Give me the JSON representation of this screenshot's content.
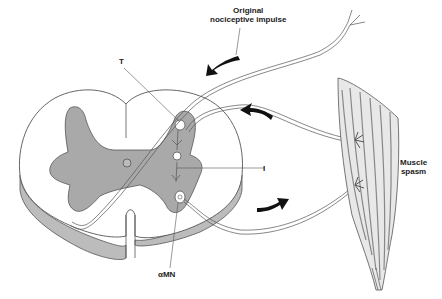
{
  "labels": {
    "original_impulse_line1": "Original",
    "original_impulse_line2": "nociceptive impulse",
    "T": "T",
    "I": "I",
    "alpha_mn": "αMN",
    "muscle_spasm_line1": "Muscle",
    "muscle_spasm_line2": "spasm"
  },
  "colors": {
    "outline": "#555555",
    "gray_matter": "#a9a9a9",
    "cord_edge": "#b8b8b8",
    "arrow": "#111111",
    "muscle": "#bdbdbd"
  }
}
